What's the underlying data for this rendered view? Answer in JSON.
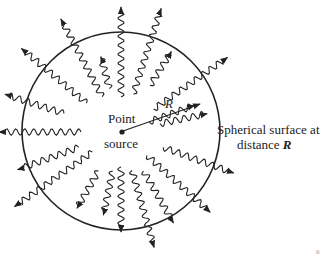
{
  "diagram": {
    "source_label_line1": "Point",
    "source_label_line2": "source",
    "radius_label": "R",
    "surface_label_line1": "Spherical surface at",
    "surface_label_line2_text": "distance",
    "surface_label_line2_var": "R",
    "corner_mark": "6",
    "colors": {
      "ink": "#222222",
      "background": "#ffffff"
    },
    "circle": {
      "cx": 121,
      "cy": 131,
      "r": 99
    },
    "source": {
      "x": 122,
      "y": 132
    },
    "radius_arrow_end": {
      "x": 201,
      "y": 104
    }
  }
}
